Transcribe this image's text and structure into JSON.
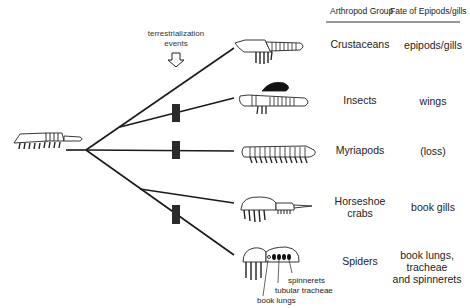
{
  "header": {
    "group_label": "Arthropod Group",
    "fate_label": "Fate of Epipods/gills"
  },
  "annotation": {
    "line1": "terrestrialization",
    "line2": "events"
  },
  "groups": [
    {
      "name": "Crustaceans",
      "fate": "epipods/gills"
    },
    {
      "name": "Insects",
      "fate": "wings"
    },
    {
      "name": "Myriapods",
      "fate": "(loss)"
    },
    {
      "name_line1": "Horseshoe",
      "name_line2": "crabs",
      "fate": "book gills"
    },
    {
      "name": "Spiders",
      "fate_line1": "book lungs, tracheae",
      "fate_line2": "and spinnerets"
    }
  ],
  "spider_labels": {
    "spinnerets": "spinnerets",
    "tubular_tracheae": "tubular tracheae",
    "book_lungs": "book lungs"
  },
  "colors": {
    "line": "#1a1a1a",
    "background": "#ffffff"
  }
}
